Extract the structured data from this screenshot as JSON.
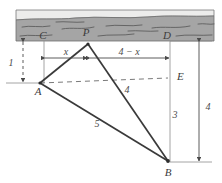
{
  "figure": {
    "background_color": "#ffffff",
    "band": {
      "name": "hatched-wall-band",
      "fill_color": "#a8a8a8",
      "top_strip_color": "#e8e8e6",
      "outline_color": "#6b6b6b",
      "texture_color": "#5f5f5f"
    },
    "line_color": "#3a3a3a",
    "thin_line_color": "#8a8a8a",
    "dashed_color": "#7a7a7a"
  },
  "points": [
    {
      "id": "C",
      "label": "C",
      "x": 43,
      "y": 35
    },
    {
      "id": "P",
      "label": "P",
      "x": 88,
      "y": 32
    },
    {
      "id": "D",
      "label": "D",
      "x": 168,
      "y": 35
    },
    {
      "id": "A",
      "label": "A",
      "x": 38,
      "y": 83
    },
    {
      "id": "E",
      "label": "E",
      "x": 170,
      "y": 76
    },
    {
      "id": "B",
      "label": "B",
      "x": 168,
      "y": 160
    }
  ],
  "dimensions": [
    {
      "id": "left-vertical",
      "label": "1",
      "orientation": "vertical",
      "between": "wall to A"
    },
    {
      "id": "top-left-span",
      "label": "x",
      "orientation": "horizontal",
      "between": "C to P"
    },
    {
      "id": "top-right-span",
      "label": "4 − x",
      "orientation": "horizontal",
      "between": "P to D"
    },
    {
      "id": "hypotenuse-ab",
      "label": "5",
      "orientation": "diagonal",
      "between": "A to B"
    },
    {
      "id": "segment-pb",
      "label": "4",
      "orientation": "diagonal",
      "between": "P to B"
    },
    {
      "id": "segment-eb",
      "label": "3",
      "orientation": "vertical",
      "between": "E to B"
    },
    {
      "id": "right-vertical",
      "label": "4",
      "orientation": "vertical",
      "between": "wall to B"
    }
  ],
  "segments": [
    {
      "id": "AP",
      "from": "A",
      "to": "P",
      "style": "solid-bold"
    },
    {
      "id": "AB",
      "from": "A",
      "to": "B",
      "style": "solid-bold"
    },
    {
      "id": "PB",
      "from": "P",
      "to": "B",
      "style": "solid-bold"
    },
    {
      "id": "AE",
      "from": "A",
      "to": "E",
      "style": "dashed"
    },
    {
      "id": "CA",
      "from": "C",
      "to": "A",
      "style": "thin"
    },
    {
      "id": "DB",
      "from": "D",
      "to": "B",
      "style": "thin"
    }
  ]
}
